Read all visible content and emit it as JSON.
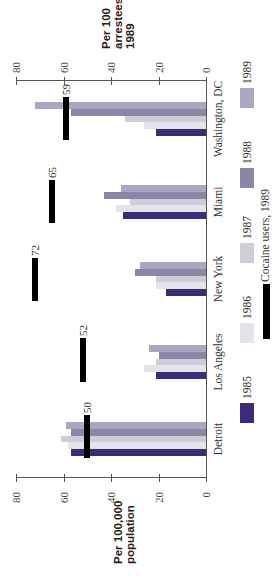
{
  "chart_data": {
    "type": "bar",
    "orientation": "rotated 90° (bars extend leftward in the screenshot)",
    "title": "",
    "categories": [
      "Detroit",
      "Los Angeles",
      "New York",
      "Miami",
      "Washington, DC"
    ],
    "series": [
      {
        "name": "1985",
        "color": "#3b2b7a",
        "values": [
          57,
          21,
          17,
          35,
          21
        ]
      },
      {
        "name": "1986",
        "color": "#e3e3ea",
        "values": [
          58,
          26,
          21,
          38,
          26
        ]
      },
      {
        "name": "1987",
        "color": "#cdced8",
        "values": [
          61,
          21,
          21,
          32,
          34
        ]
      },
      {
        "name": "1988",
        "color": "#8a87a6",
        "values": [
          57,
          20,
          30,
          43,
          57
        ]
      },
      {
        "name": "1989",
        "color": "#a9a8c0",
        "values": [
          59,
          24,
          28,
          36,
          72
        ]
      }
    ],
    "overlay_series": {
      "name": "Cocaine users, 1989",
      "color": "#000000",
      "unit_axis": "Per 100 arrestees 1989",
      "values": [
        50,
        52,
        72,
        65,
        59
      ]
    },
    "axes": {
      "primary": {
        "label": "Per 100,000 population",
        "ticks": [
          0,
          20,
          40,
          60,
          80
        ],
        "range": [
          0,
          80
        ]
      },
      "secondary": {
        "label": "Per 100 arrestees 1989",
        "ticks": [
          0,
          20,
          40,
          60,
          80
        ],
        "range": [
          0,
          80
        ]
      }
    },
    "xlabel": "",
    "ylabel": "Per 100,000 population",
    "ylim": [
      0,
      80
    ],
    "grid": false,
    "legend_position": "bottom (right side of rotated image)"
  },
  "labels": {
    "top_axis_title_lines": [
      "Per 100",
      "arrestees",
      "1989"
    ],
    "bottom_axis_title_lines": [
      "Per 100,000",
      "population"
    ],
    "legend_overlay": "Cocaine users, 1989"
  }
}
